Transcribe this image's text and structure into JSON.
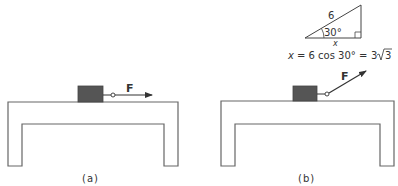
{
  "panels": [
    {
      "id": "a",
      "caption": "(a)",
      "force_label": "F",
      "force_direction": "horizontal"
    },
    {
      "id": "b",
      "caption": "(b)",
      "force_label": "F",
      "force_direction": "angled up-right"
    }
  ],
  "triangle": {
    "hypotenuse_label": "6",
    "angle_label": "30°",
    "base_label": "x",
    "right_angle_marker": true
  },
  "equation": {
    "lhs": "x",
    "eq1": "= 6 cos 30° =",
    "rhs_coef": "3",
    "rhs_radicand": "3"
  },
  "colors": {
    "line": "#555555",
    "block_fill": "#555555",
    "text": "#333333",
    "background": "#ffffff"
  }
}
